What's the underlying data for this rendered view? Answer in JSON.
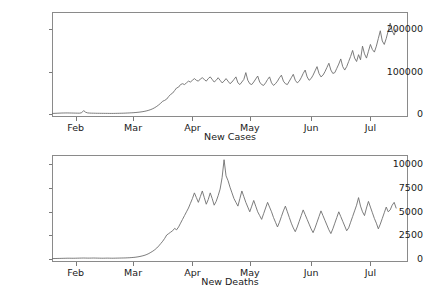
{
  "figure": {
    "width": 423,
    "height": 300,
    "background_color": "#ffffff",
    "line_color": "#6e6e6e",
    "frame_color": "#8a8a8a"
  },
  "chart_data": [
    {
      "type": "line",
      "title": "",
      "xlabel": "New Cases",
      "ylabel": "",
      "grid": false,
      "legend": null,
      "xlim": [
        0,
        180
      ],
      "ylim": [
        -6000,
        240000
      ],
      "xticks": [
        12,
        41,
        71,
        100,
        131,
        161
      ],
      "xticklabels": [
        "Feb",
        "Mar",
        "Apr",
        "May",
        "Jun",
        "Jul"
      ],
      "yticks": [
        0,
        100000,
        200000
      ],
      "yticklabels": [
        "0",
        "100000",
        "200000"
      ],
      "series": [
        {
          "name": "New Cases",
          "x": [
            0,
            1,
            2,
            3,
            4,
            5,
            6,
            7,
            8,
            9,
            10,
            11,
            12,
            13,
            14,
            15,
            16,
            17,
            18,
            19,
            20,
            21,
            22,
            23,
            24,
            25,
            26,
            27,
            28,
            29,
            30,
            31,
            32,
            33,
            34,
            35,
            36,
            37,
            38,
            39,
            40,
            41,
            42,
            43,
            44,
            45,
            46,
            47,
            48,
            49,
            50,
            51,
            52,
            53,
            54,
            55,
            56,
            57,
            58,
            59,
            60,
            61,
            62,
            63,
            64,
            65,
            66,
            67,
            68,
            69,
            70,
            71,
            72,
            73,
            74,
            75,
            76,
            77,
            78,
            79,
            80,
            81,
            82,
            83,
            84,
            85,
            86,
            87,
            88,
            89,
            90,
            91,
            92,
            93,
            94,
            95,
            96,
            97,
            98,
            99,
            100,
            101,
            102,
            103,
            104,
            105,
            106,
            107,
            108,
            109,
            110,
            111,
            112,
            113,
            114,
            115,
            116,
            117,
            118,
            119,
            120,
            121,
            122,
            123,
            124,
            125,
            126,
            127,
            128,
            129,
            130,
            131,
            132,
            133,
            134,
            135,
            136,
            137,
            138,
            139,
            140,
            141,
            142,
            143,
            144,
            145,
            146,
            147,
            148,
            149,
            150,
            151,
            152,
            153,
            154,
            155,
            156,
            157,
            158,
            159,
            160,
            161,
            162,
            163,
            164,
            165,
            166,
            167,
            168,
            169,
            170,
            171,
            172,
            173,
            174
          ],
          "values": [
            2200,
            2500,
            2700,
            2900,
            3100,
            3300,
            3400,
            3500,
            3500,
            3400,
            3300,
            3200,
            3100,
            3000,
            3000,
            4000,
            9000,
            5200,
            3600,
            3200,
            3000,
            2900,
            2800,
            2700,
            2700,
            2600,
            2600,
            2500,
            2500,
            2400,
            2400,
            2400,
            2500,
            2600,
            2700,
            2800,
            2900,
            3100,
            3300,
            3500,
            3800,
            4000,
            4400,
            4800,
            5300,
            5900,
            6600,
            7500,
            8600,
            9900,
            11500,
            13500,
            16000,
            19000,
            22500,
            26500,
            31000,
            33000,
            36000,
            42000,
            47000,
            50000,
            56000,
            62000,
            64000,
            70000,
            72000,
            70000,
            74000,
            78000,
            76000,
            80000,
            84000,
            80000,
            78000,
            83000,
            86000,
            82000,
            78000,
            84000,
            88000,
            82000,
            76000,
            80000,
            86000,
            80000,
            74000,
            78000,
            84000,
            78000,
            72000,
            76000,
            82000,
            88000,
            74000,
            70000,
            76000,
            82000,
            98000,
            80000,
            72000,
            70000,
            76000,
            83000,
            90000,
            76000,
            70000,
            68000,
            74000,
            82000,
            88000,
            74000,
            68000,
            72000,
            78000,
            86000,
            92000,
            78000,
            72000,
            70000,
            78000,
            86000,
            94000,
            80000,
            74000,
            78000,
            86000,
            96000,
            104000,
            88000,
            80000,
            84000,
            92000,
            102000,
            112000,
            96000,
            88000,
            92000,
            100000,
            110000,
            120000,
            104000,
            96000,
            98000,
            108000,
            118000,
            130000,
            112000,
            104000,
            112000,
            124000,
            136000,
            150000,
            132000,
            124000,
            140000,
            128000,
            160000,
            142000,
            132000,
            148000,
            164000,
            152000,
            146000,
            160000,
            178000,
            196000,
            172000,
            164000,
            178000,
            196000,
            214000,
            196000,
            186000,
            200000,
            218000,
            232000,
            212000,
            226000
          ]
        }
      ]
    },
    {
      "type": "line",
      "title": "",
      "xlabel": "New Deaths",
      "ylabel": "",
      "grid": false,
      "legend": null,
      "xlim": [
        0,
        180
      ],
      "ylim": [
        -300,
        11000
      ],
      "xticks": [
        12,
        41,
        71,
        100,
        131,
        161
      ],
      "xticklabels": [
        "Feb",
        "Mar",
        "Apr",
        "May",
        "Jun",
        "Jul"
      ],
      "yticks": [
        0,
        2500,
        5000,
        7500,
        10000
      ],
      "yticklabels": [
        "0",
        "2500",
        "5000",
        "7500",
        "10000"
      ],
      "series": [
        {
          "name": "New Deaths",
          "x": [
            0,
            1,
            2,
            3,
            4,
            5,
            6,
            7,
            8,
            9,
            10,
            11,
            12,
            13,
            14,
            15,
            16,
            17,
            18,
            19,
            20,
            21,
            22,
            23,
            24,
            25,
            26,
            27,
            28,
            29,
            30,
            31,
            32,
            33,
            34,
            35,
            36,
            37,
            38,
            39,
            40,
            41,
            42,
            43,
            44,
            45,
            46,
            47,
            48,
            49,
            50,
            51,
            52,
            53,
            54,
            55,
            56,
            57,
            58,
            59,
            60,
            61,
            62,
            63,
            64,
            65,
            66,
            67,
            68,
            69,
            70,
            71,
            72,
            73,
            74,
            75,
            76,
            77,
            78,
            79,
            80,
            81,
            82,
            83,
            84,
            85,
            86,
            87,
            88,
            89,
            90,
            91,
            92,
            93,
            94,
            95,
            96,
            97,
            98,
            99,
            100,
            101,
            102,
            103,
            104,
            105,
            106,
            107,
            108,
            109,
            110,
            111,
            112,
            113,
            114,
            115,
            116,
            117,
            118,
            119,
            120,
            121,
            122,
            123,
            124,
            125,
            126,
            127,
            128,
            129,
            130,
            131,
            132,
            133,
            134,
            135,
            136,
            137,
            138,
            139,
            140,
            141,
            142,
            143,
            144,
            145,
            146,
            147,
            148,
            149,
            150,
            151,
            152,
            153,
            154,
            155,
            156,
            157,
            158,
            159,
            160,
            161,
            162,
            163,
            164,
            165,
            166,
            167,
            168,
            169,
            170,
            171,
            172,
            173,
            174
          ],
          "values": [
            60,
            65,
            70,
            75,
            80,
            85,
            90,
            95,
            100,
            100,
            95,
            95,
            100,
            105,
            110,
            115,
            120,
            115,
            110,
            110,
            115,
            120,
            115,
            110,
            105,
            100,
            100,
            105,
            110,
            105,
            100,
            100,
            105,
            110,
            115,
            120,
            125,
            130,
            140,
            150,
            165,
            180,
            200,
            230,
            265,
            310,
            360,
            420,
            500,
            600,
            720,
            850,
            1000,
            1180,
            1400,
            1650,
            1900,
            2200,
            2550,
            2700,
            2850,
            3000,
            3250,
            3100,
            3400,
            3800,
            4200,
            4600,
            5000,
            5400,
            5900,
            6400,
            7000,
            6500,
            6000,
            6600,
            7200,
            6500,
            5800,
            6300,
            7000,
            6400,
            5700,
            6100,
            6700,
            7400,
            8600,
            10500,
            8800,
            8300,
            7600,
            7000,
            6400,
            6000,
            5600,
            6400,
            7200,
            6600,
            6000,
            5500,
            5000,
            5600,
            6200,
            5600,
            5000,
            4600,
            4200,
            4800,
            5400,
            6000,
            5500,
            5000,
            4400,
            3900,
            3400,
            3900,
            4500,
            5100,
            5600,
            5000,
            4400,
            3800,
            3300,
            2900,
            3400,
            4000,
            4600,
            5200,
            4700,
            4200,
            3700,
            3200,
            2800,
            3300,
            3900,
            4500,
            5100,
            4600,
            4100,
            3600,
            3100,
            2700,
            3200,
            3800,
            4400,
            5000,
            4500,
            4000,
            3500,
            3000,
            3300,
            3900,
            4500,
            5100,
            5700,
            6500,
            5600,
            5000,
            4600,
            5400,
            6100,
            5500,
            4900,
            4300,
            3800,
            3200,
            3700,
            4300,
            4900,
            5500,
            5000,
            5200,
            5700,
            6000,
            5400,
            5100
          ]
        }
      ]
    }
  ]
}
